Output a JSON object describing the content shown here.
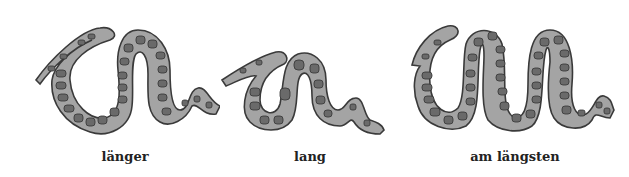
{
  "illustration": {
    "colors": {
      "snake_body": "#a4a4a4",
      "snake_spots": "#6a6a6a",
      "outline": "#3a3a3a",
      "background": "#ffffff"
    },
    "snakes": [
      {
        "id": "snake-longer",
        "label": "länger"
      },
      {
        "id": "snake-long",
        "label": "lang"
      },
      {
        "id": "snake-longest",
        "label": "am längsten"
      }
    ]
  }
}
